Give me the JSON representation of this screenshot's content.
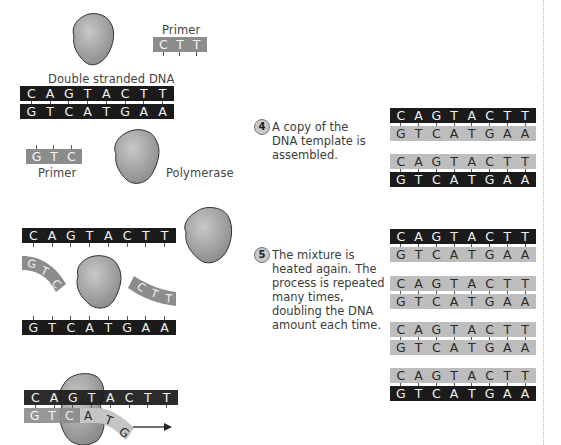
{
  "colors": {
    "strand_black": "#1b1b1b",
    "strand_gray": "#bdbdbd",
    "primer_gray": "#8c8c8c",
    "enzyme_fill": "#a8a8a8",
    "text": "#444444"
  },
  "icons": {
    "enzyme": "polymerase-blob-icon",
    "step_badge": "circled-number-icon",
    "direction": "arrow-right-icon"
  },
  "labels": {
    "primer_top": "Primer",
    "double_stranded": "Double stranded DNA",
    "primer_bottom": "Primer",
    "polymerase": "Polymerase"
  },
  "sequences": {
    "template_top": [
      "C",
      "A",
      "G",
      "T",
      "A",
      "C",
      "T",
      "T"
    ],
    "template_bottom": [
      "G",
      "T",
      "C",
      "A",
      "T",
      "G",
      "A",
      "A"
    ],
    "primer_ctt": [
      "C",
      "T",
      "T"
    ],
    "primer_gtc": [
      "G",
      "T",
      "C"
    ],
    "extending": [
      "A",
      "T",
      "G"
    ]
  },
  "steps": [
    {
      "number": "4",
      "lines": [
        "A copy of the",
        "DNA template is",
        "assembled."
      ]
    },
    {
      "number": "5",
      "lines": [
        "The mixture is",
        "heated again. The",
        "process is repeated",
        "many times,",
        "doubling the DNA",
        "amount each time."
      ]
    }
  ],
  "step4_pairs": [
    {
      "top_style": "black",
      "bottom_style": "gray"
    },
    {
      "top_style": "gray",
      "bottom_style": "black"
    }
  ],
  "step5_pairs": [
    {
      "top_style": "black",
      "bottom_style": "gray"
    },
    {
      "top_style": "gray",
      "bottom_style": "gray"
    },
    {
      "top_style": "gray",
      "bottom_style": "gray"
    },
    {
      "top_style": "gray",
      "bottom_style": "black"
    }
  ]
}
